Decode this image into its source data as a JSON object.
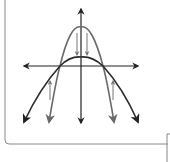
{
  "diagram": {
    "title": "",
    "colors": {
      "axes": "#222222",
      "narrow_parabola": "#6a6a6a",
      "wide_parabola": "#2a2a2a",
      "transform_arrows": "#777777",
      "border": "#888888"
    },
    "axes": {
      "x_label": "",
      "y_label": ""
    },
    "curves": [
      {
        "name": "narrow-parabola",
        "shape": "downward, narrow, higher vertex"
      },
      {
        "name": "wide-parabola",
        "shape": "downward, wide, lower vertex"
      }
    ],
    "transform_arrows": [
      {
        "name": "down-arrow-left",
        "direction": "down"
      },
      {
        "name": "down-arrow-right",
        "direction": "down"
      },
      {
        "name": "up-arrow-left",
        "direction": "up"
      },
      {
        "name": "up-arrow-right",
        "direction": "up"
      }
    ]
  }
}
